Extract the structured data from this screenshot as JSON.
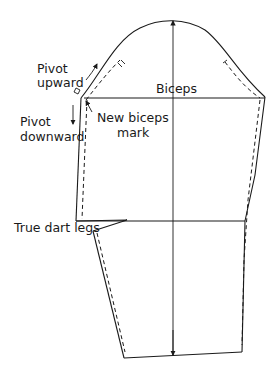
{
  "diagram": {
    "type": "sleeve-pattern",
    "labels": {
      "pivot_upward_line1": "Pivot",
      "pivot_upward_line2": "upward",
      "pivot_downward_line1": "Pivot",
      "pivot_downward_line2": "downward",
      "biceps": "Biceps",
      "new_biceps_line1": "New biceps",
      "new_biceps_line2": "mark",
      "true_dart_legs": "True dart legs"
    },
    "colors": {
      "line": "#1a1a1a",
      "background": "#ffffff"
    }
  }
}
